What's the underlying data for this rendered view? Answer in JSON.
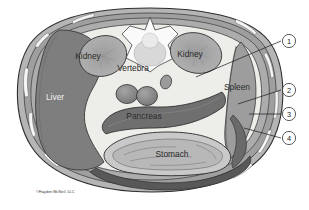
{
  "figure": {
    "background_color": "#ffffff",
    "credit": "©Hayden McNeil, LLC"
  },
  "organ_labels": [
    {
      "id": "liver",
      "text": "Liver",
      "x": 55,
      "y": 100,
      "style": "light"
    },
    {
      "id": "kidney-left",
      "text": "Kidney",
      "x": 88,
      "y": 59,
      "style": "dark"
    },
    {
      "id": "vertebra",
      "text": "Vertebra",
      "x": 133,
      "y": 71,
      "style": "dark"
    },
    {
      "id": "kidney-right",
      "text": "Kidney",
      "x": 186,
      "y": 57,
      "style": "dark"
    },
    {
      "id": "spleen",
      "text": "Spleen",
      "x": 224,
      "y": 90,
      "style": "dark"
    },
    {
      "id": "pancreas",
      "text": "Pancreas",
      "x": 130,
      "y": 117,
      "style": "dark"
    },
    {
      "id": "stomach",
      "text": "Stomach",
      "x": 166,
      "y": 157,
      "style": "dark"
    }
  ],
  "callouts": [
    {
      "number": "1",
      "cx": 289,
      "cy": 41,
      "leader_from_x": 281,
      "leader_from_y": 41,
      "leader_to_x": 196,
      "leader_to_y": 77
    },
    {
      "number": "2",
      "cx": 289,
      "cy": 90,
      "leader_from_x": 281,
      "leader_from_y": 90,
      "leader_to_x": 238,
      "leader_to_y": 104
    },
    {
      "number": "3",
      "cx": 289,
      "cy": 114,
      "leader_from_x": 281,
      "leader_from_y": 114,
      "leader_to_x": 249,
      "leader_to_y": 114
    },
    {
      "number": "4",
      "cx": 289,
      "cy": 138,
      "leader_from_x": 281,
      "leader_from_y": 138,
      "leader_to_x": 244,
      "leader_to_y": 128
    }
  ],
  "colors": {
    "outer_wall_fill": "#b5b5b5",
    "outer_wall_stroke": "#3c3c3c",
    "muscle_band": "#8e8e8e",
    "highlight_slit": "#f4f4f4",
    "cavity_fill": "#ededea",
    "liver_fill": "#7e7e7e",
    "kidney_fill": "#a9a9a9",
    "vertebra_fill": "#fafafa",
    "vessel_fill": "#8a8a8a",
    "pancreas_fill": "#6f6f6f",
    "stomach_fill": "#c9c9c9",
    "spleen_fill": "#9d9d9d",
    "line": "#1a1a1a"
  }
}
